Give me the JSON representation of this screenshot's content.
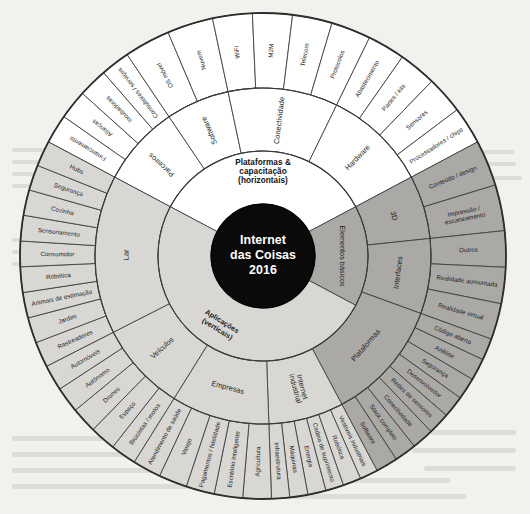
{
  "diagram": {
    "hub": {
      "line1": "Internet",
      "line2": "das Coisas",
      "line3": "2016"
    },
    "colors": {
      "background": "#f2f1ee",
      "hub": "#0a0a0a",
      "ring_light": "#ffffff",
      "ring_mid": "#d8d7d3",
      "ring_dark": "#aaa9a6",
      "stroke": "#3b3b3b",
      "text": "#1d1d1d"
    },
    "inner_ring": [
      {
        "label": "Plataformas & capacitação (horizontais)",
        "lines": [
          "Plataformas &",
          "capacitação",
          "(horizontais)"
        ],
        "tone": "light"
      },
      {
        "label": "Elementos básicos",
        "lines": [
          "Elementos básicos"
        ],
        "tone": "dark"
      },
      {
        "label": "Aplicações (verticais)",
        "lines": [
          "Aplicações",
          "(verticais)"
        ],
        "tone": "mid"
      }
    ],
    "middle_ring": [
      {
        "label": "Pessoal",
        "tone": "mid"
      },
      {
        "label": "Parceiros",
        "tone": "light"
      },
      {
        "label": "Software",
        "tone": "light"
      },
      {
        "label": "Conectividade",
        "tone": "light"
      },
      {
        "label": "Hardware",
        "tone": "light"
      },
      {
        "label": "3D",
        "tone": "dark"
      },
      {
        "label": "Interfaces",
        "tone": "dark"
      },
      {
        "label": "Plataformas",
        "tone": "dark"
      },
      {
        "label": "Internet industrial",
        "lines": [
          "Internet",
          "industrial"
        ],
        "tone": "mid"
      },
      {
        "label": "Empresas",
        "tone": "mid"
      },
      {
        "label": "Veículos",
        "tone": "mid"
      },
      {
        "label": "Lar",
        "tone": "mid"
      }
    ],
    "outer_ring": [
      {
        "label": "Financiamento",
        "tone": "light",
        "group": "Parceiros"
      },
      {
        "label": "Alianças",
        "tone": "light",
        "group": "Parceiros"
      },
      {
        "label": "Incubadoras",
        "tone": "light",
        "group": "Parceiros"
      },
      {
        "label": "Consultores / serviços",
        "tone": "light",
        "group": "Parceiros"
      },
      {
        "label": "OS móvel",
        "tone": "light",
        "group": "Software"
      },
      {
        "label": "Nuvem",
        "tone": "light",
        "group": "Software"
      },
      {
        "label": "WiFi",
        "tone": "light",
        "group": "Conectividade"
      },
      {
        "label": "M2M",
        "tone": "light",
        "group": "Conectividade"
      },
      {
        "label": "Telecom",
        "tone": "light",
        "group": "Conectividade"
      },
      {
        "label": "Protocolos",
        "tone": "light",
        "group": "Conectividade"
      },
      {
        "label": "Abastecimento",
        "tone": "light",
        "group": "Hardware"
      },
      {
        "label": "Partes / kits",
        "tone": "light",
        "group": "Hardware"
      },
      {
        "label": "Sensores",
        "tone": "light",
        "group": "Hardware"
      },
      {
        "label": "Processadores / chips",
        "tone": "light",
        "group": "Hardware"
      },
      {
        "label": "Conteúdo / design",
        "tone": "dark",
        "group": "3D"
      },
      {
        "label": "Impressão / escaneamento",
        "lines": [
          "Impressão /",
          "escaneamento"
        ],
        "tone": "dark",
        "group": "3D"
      },
      {
        "label": "Outros",
        "tone": "dark",
        "group": "Interfaces"
      },
      {
        "label": "Realidade aumentada",
        "tone": "dark",
        "group": "Interfaces"
      },
      {
        "label": "Realidade virtual",
        "tone": "dark",
        "group": "Interfaces"
      },
      {
        "label": "Código aberto",
        "tone": "dark",
        "group": "Plataformas"
      },
      {
        "label": "Análise",
        "tone": "dark",
        "group": "Plataformas"
      },
      {
        "label": "Segurança",
        "tone": "dark",
        "group": "Plataformas"
      },
      {
        "label": "Desenvolvedor",
        "tone": "dark",
        "group": "Plataformas"
      },
      {
        "label": "Redes de sensores",
        "tone": "dark",
        "group": "Plataformas"
      },
      {
        "label": "Conectividade",
        "tone": "dark",
        "group": "Plataformas"
      },
      {
        "label": "Stack completo",
        "tone": "dark",
        "group": "Plataformas"
      },
      {
        "label": "Software",
        "tone": "dark",
        "group": "Plataformas"
      },
      {
        "label": "Vestíveis industriais",
        "tone": "mid",
        "group": "Internet industrial"
      },
      {
        "label": "Robótica",
        "tone": "mid",
        "group": "Internet industrial"
      },
      {
        "label": "Cadeia de suprimento",
        "tone": "mid",
        "group": "Internet industrial"
      },
      {
        "label": "Energia",
        "tone": "mid",
        "group": "Internet industrial"
      },
      {
        "label": "Máquinas",
        "tone": "mid",
        "group": "Internet industrial"
      },
      {
        "label": "Infraestrutura",
        "tone": "mid",
        "group": "Internet industrial"
      },
      {
        "label": "Agricultura",
        "tone": "mid",
        "group": "Empresas"
      },
      {
        "label": "Escritório inteligente",
        "tone": "mid",
        "group": "Empresas"
      },
      {
        "label": "Pagamentos / fidelidade",
        "tone": "mid",
        "group": "Empresas"
      },
      {
        "label": "Varejo",
        "tone": "mid",
        "group": "Empresas"
      },
      {
        "label": "Atendimento de saúde",
        "tone": "mid",
        "group": "Empresas"
      },
      {
        "label": "Bicicletas / motos",
        "tone": "mid",
        "group": "Veículos"
      },
      {
        "label": "Espaço",
        "tone": "mid",
        "group": "Veículos"
      },
      {
        "label": "Drones",
        "tone": "mid",
        "group": "Veículos"
      },
      {
        "label": "Autônomo",
        "tone": "mid",
        "group": "Veículos"
      },
      {
        "label": "Automóveis",
        "tone": "mid",
        "group": "Veículos"
      },
      {
        "label": "Rastreadores",
        "tone": "mid",
        "group": "Lar"
      },
      {
        "label": "Jardim",
        "tone": "mid",
        "group": "Lar"
      },
      {
        "label": "Animais de estimação",
        "tone": "mid",
        "group": "Lar"
      },
      {
        "label": "Robótica",
        "tone": "mid",
        "group": "Lar"
      },
      {
        "label": "Consumidor",
        "tone": "mid",
        "group": "Lar"
      },
      {
        "label": "Sensoriamento",
        "tone": "mid",
        "group": "Lar"
      },
      {
        "label": "Cozinha",
        "tone": "mid",
        "group": "Lar"
      },
      {
        "label": "Segurança",
        "tone": "mid",
        "group": "Lar"
      },
      {
        "label": "Hubs",
        "tone": "mid",
        "group": "Lar"
      },
      {
        "label": "Automação",
        "tone": "mid",
        "group": "Pessoal"
      },
      {
        "label": "Brinquedos",
        "tone": "mid",
        "group": "Pessoal"
      },
      {
        "label": "Idosos",
        "tone": "mid",
        "group": "Pessoal"
      },
      {
        "label": "Esportes",
        "tone": "mid",
        "group": "Pessoal"
      },
      {
        "label": "Família",
        "tone": "mid",
        "group": "Pessoal"
      },
      {
        "label": "Entretenimento",
        "tone": "mid",
        "group": "Pessoal"
      },
      {
        "label": "Saúde",
        "tone": "mid",
        "group": "Pessoal"
      },
      {
        "label": "Vestíveis",
        "tone": "mid",
        "group": "Pessoal"
      },
      {
        "label": "Fitness",
        "tone": "mid",
        "group": "Pessoal"
      }
    ]
  },
  "chart_data": {
    "type": "pie",
    "xlabel": "",
    "ylabel": "",
    "legend_position": "none",
    "grid": false,
    "note": "Three-level radial sunburst (hierarchy wheel) of the IoT landscape, labels in Portuguese.",
    "levels": [
      {
        "level": 1,
        "name": "inner_ring",
        "categories": [
          "Plataformas & capacitação (horizontais)",
          "Elementos básicos",
          "Aplicações (verticais)"
        ],
        "values": [
          33.3,
          33.3,
          33.4
        ]
      },
      {
        "level": 2,
        "name": "middle_ring",
        "categories": [
          "Parceiros",
          "Software",
          "Conectividade",
          "Hardware",
          "3D",
          "Interfaces",
          "Plataformas",
          "Internet industrial",
          "Empresas",
          "Veículos",
          "Lar",
          "Pessoal"
        ],
        "values": [
          4,
          2,
          4,
          4,
          2,
          3,
          8,
          6,
          5,
          5,
          9,
          9
        ]
      },
      {
        "level": 3,
        "name": "outer_ring",
        "categories": [
          "Financiamento",
          "Alianças",
          "Incubadoras",
          "Consultores / serviços",
          "OS móvel",
          "Nuvem",
          "WiFi",
          "M2M",
          "Telecom",
          "Protocolos",
          "Abastecimento",
          "Partes / kits",
          "Sensores",
          "Processadores / chips",
          "Conteúdo / design",
          "Impressão / escaneamento",
          "Outros",
          "Realidade aumentada",
          "Realidade virtual",
          "Código aberto",
          "Análise",
          "Segurança",
          "Desenvolvedor",
          "Redes de sensores",
          "Conectividade",
          "Stack completo",
          "Software",
          "Vestíveis industriais",
          "Robótica",
          "Cadeia de suprimento",
          "Energia",
          "Máquinas",
          "Infraestrutura",
          "Agricultura",
          "Escritório inteligente",
          "Pagamentos / fidelidade",
          "Varejo",
          "Atendimento de saúde",
          "Bicicletas / motos",
          "Espaço",
          "Drones",
          "Autônomo",
          "Automóveis",
          "Rastreadores",
          "Jardim",
          "Animais de estimação",
          "Robótica",
          "Consumidor",
          "Sensoriamento",
          "Cozinha",
          "Segurança",
          "Hubs",
          "Automação",
          "Brinquedos",
          "Idosos",
          "Esportes",
          "Família",
          "Entretenimento",
          "Saúde",
          "Vestíveis",
          "Fitness"
        ],
        "values": [
          1,
          1,
          1,
          1,
          1,
          1,
          1,
          1,
          1,
          1,
          1,
          1,
          1,
          1,
          1,
          1,
          1,
          1,
          1,
          1,
          1,
          1,
          1,
          1,
          1,
          1,
          1,
          1,
          1,
          1,
          1,
          1,
          1,
          1,
          1,
          1,
          1,
          1,
          1,
          1,
          1,
          1,
          1,
          1,
          1,
          1,
          1,
          1,
          1,
          1,
          1,
          1,
          1,
          1,
          1,
          1,
          1,
          1,
          1,
          1,
          1
        ]
      }
    ]
  }
}
